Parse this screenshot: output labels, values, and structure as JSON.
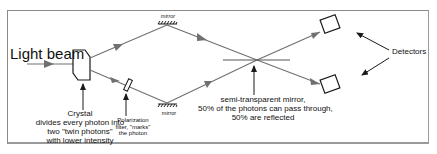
{
  "diagram": {
    "labels": {
      "light_beam": "Light beam",
      "crystal_line1": "Crystal",
      "crystal_line2": "divides  every photon into",
      "crystal_line3": "two \"twin photons\"",
      "crystal_line4": "with lower intensity",
      "polarization_line1": "Polarization",
      "polarization_line2": "filter, \"marks\"",
      "polarization_line3": "the photon",
      "mirror_top": "mirror",
      "mirror_bottom": "mirror",
      "semi_line1": "semi-transparent mirror,",
      "semi_line2": "50% of the photons can pass through,",
      "semi_line3": "50% are reflected",
      "detectors": "Detectors"
    },
    "colors": {
      "beam": "#707070",
      "outline": "#1a1a1a",
      "frame": "#8a8a8a"
    }
  }
}
